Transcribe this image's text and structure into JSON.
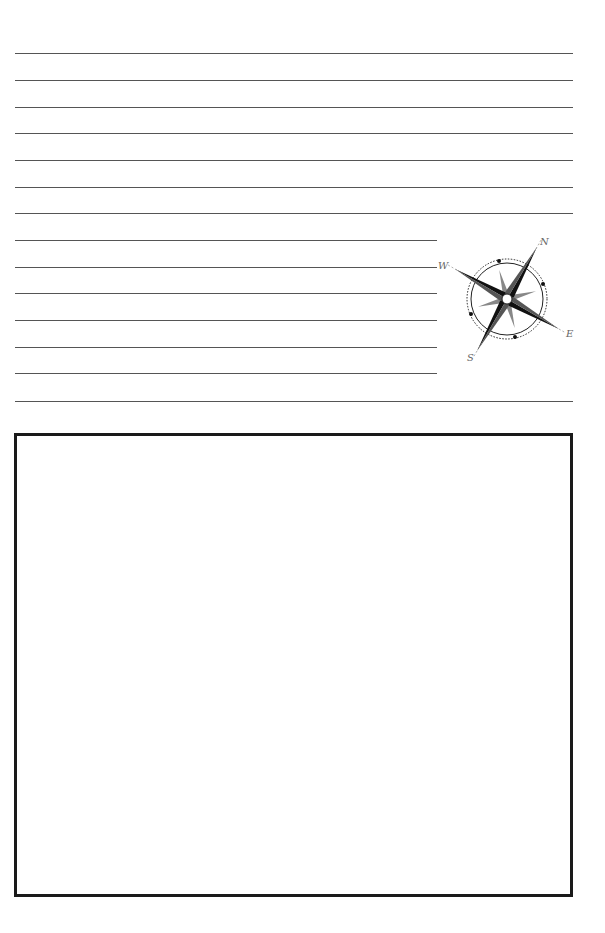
{
  "page": {
    "type": "journal-page",
    "background": "#ffffff",
    "line_color": "#555555",
    "border_color": "#1a1a1a"
  },
  "lines": {
    "count": 15,
    "full_width_rows": [
      1,
      2,
      3,
      4,
      5,
      6,
      7,
      15
    ],
    "short_rows": [
      8,
      9,
      10,
      11,
      12,
      13,
      14
    ]
  },
  "compass": {
    "labels": {
      "north": "N",
      "south": "S",
      "east": "E",
      "west": "W"
    }
  },
  "drawing_box": {
    "content": ""
  }
}
